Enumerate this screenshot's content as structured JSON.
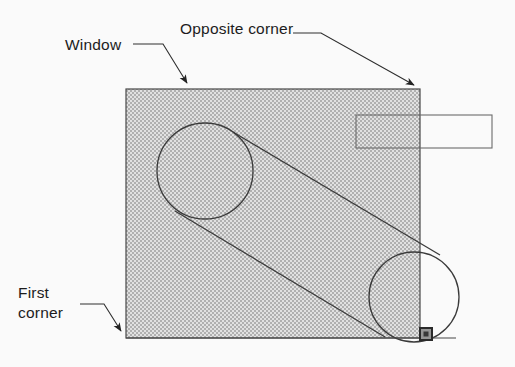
{
  "figure": {
    "background_color": "#ffffff",
    "width": 515,
    "height": 367
  },
  "labels": [
    {
      "id": "window",
      "text": "Window",
      "lines": [
        "Window"
      ],
      "x": 65,
      "y": 50,
      "leader": "M 133 44 L 163 44 L 189 85",
      "arrow_at": [
        190,
        89
      ]
    },
    {
      "id": "opposite-corner",
      "text": "Opposite corner",
      "lines": [
        "Opposite corner"
      ],
      "x": 180,
      "y": 34,
      "leader": "M 293 33 L 321 33 L 416 86",
      "arrow_at": [
        420,
        90
      ]
    },
    {
      "id": "first-corner",
      "text": "First corner",
      "lines": [
        "First",
        "corner"
      ],
      "x": 18,
      "y": 298,
      "leader": "M 80 304 L 104 304 L 123 333",
      "arrow_at": [
        126,
        338
      ]
    }
  ],
  "window_box": {
    "name": "selection-window",
    "x": 126,
    "y": 89,
    "width": 294,
    "height": 249,
    "fill_pattern": "checkerboard-dither-50",
    "fill_color": "#c9c9c9",
    "border_color": "#4a4a4a"
  },
  "callout_box": {
    "name": "empty-callout-box",
    "x": 356,
    "y": 115,
    "width": 136,
    "height": 33,
    "text": "",
    "border_color": "#6e6e6e"
  },
  "baseline_rule": {
    "name": "baseline-rule",
    "x1": 126,
    "y1": 338,
    "x2": 456,
    "y2": 338,
    "color": "#4a4a4a"
  },
  "grip_handle": {
    "name": "corner-grip-handle",
    "cx": 426,
    "cy": 334,
    "size": 14,
    "outer_color": "#2b2b2b",
    "inner_color": "#9a9a9a"
  },
  "geometry": {
    "type": "belt-and-pulley",
    "circles": [
      {
        "id": "left-pulley",
        "cx": 205,
        "cy": 171,
        "r": 48
      },
      {
        "id": "right-pulley",
        "cx": 414,
        "cy": 297,
        "r": 45
      }
    ],
    "tangent_lines": [
      {
        "id": "upper-tangent",
        "x1": 233,
        "y1": 132,
        "x2": 440,
        "y2": 255
      },
      {
        "id": "lower-tangent",
        "x1": 175,
        "y1": 211,
        "x2": 385,
        "y2": 337
      }
    ]
  },
  "colors": {
    "ink": "#1d1d1d",
    "line": "#3c3c3c",
    "fill_gray": "#c9c9c9",
    "paper": "#ffffff"
  }
}
